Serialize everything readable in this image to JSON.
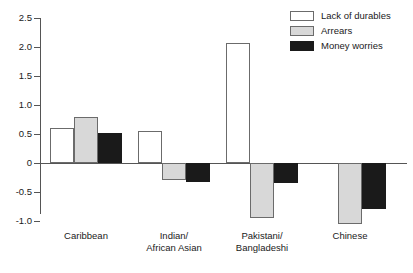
{
  "chart_data": {
    "type": "bar",
    "title": "",
    "subtitle": "",
    "xlabel": "",
    "ylabel": "",
    "ylim": [
      -1.0,
      2.5
    ],
    "yticks": [
      "2.5",
      "2.0",
      "1.5",
      "1.0",
      "0.5",
      "0",
      "-0.5",
      "-1.0"
    ],
    "ytick_values": [
      2.5,
      2.0,
      1.5,
      1.0,
      0.5,
      0,
      -0.5,
      -1.0
    ],
    "grid": false,
    "legend_position": "top-right",
    "categories": [
      "Caribbean",
      "Indian/\nAfrican Asian",
      "Pakistani/\nBangladeshi",
      "Chinese"
    ],
    "series": [
      {
        "name": "Lack of durables",
        "color": "#ffffff",
        "values": [
          0.6,
          0.55,
          2.07,
          0.0
        ]
      },
      {
        "name": "Arrears",
        "color": "#d8d8d8",
        "values": [
          0.8,
          -0.3,
          -0.95,
          -1.05
        ]
      },
      {
        "name": "Money worries",
        "color": "#1a1a1a",
        "values": [
          0.51,
          -0.32,
          -0.35,
          -0.8
        ]
      }
    ]
  },
  "legend": {
    "items": [
      {
        "label": "Lack of durables"
      },
      {
        "label": "Arrears"
      },
      {
        "label": "Money worries"
      }
    ]
  },
  "axis": {
    "y_tick_labels": [
      "2.5",
      "2.0",
      "1.5",
      "1.0",
      "0.5",
      "0",
      "-0.5",
      "-1.0"
    ]
  },
  "x_axis": {
    "labels": [
      "Caribbean",
      "Indian/\nAfrican Asian",
      "Pakistani/\nBangladeshi",
      "Chinese"
    ]
  }
}
